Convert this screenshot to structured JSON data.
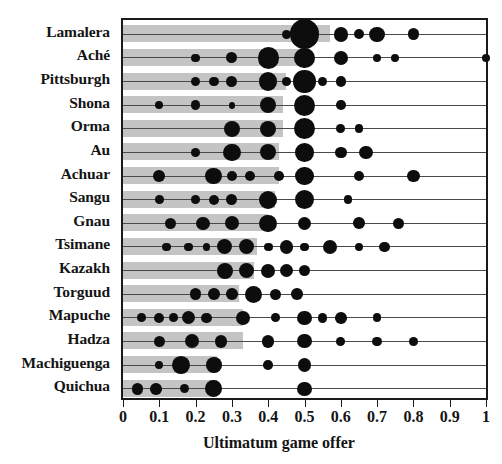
{
  "chart_data": {
    "type": "scatter",
    "title": "",
    "xlabel": "Ultimatum game offer",
    "ylabel": "",
    "xlim": [
      0,
      1
    ],
    "xticks": [
      0,
      0.1,
      0.2,
      0.3,
      0.4,
      0.5,
      0.6,
      0.7,
      0.8,
      0.9,
      1
    ],
    "xticklabels": [
      "0",
      "0.1",
      "0.2",
      "0.3",
      "0.4",
      "0.5",
      "0.6",
      "0.7",
      "0.8",
      "0.9",
      "1"
    ],
    "grid": false,
    "legend": null,
    "marker_note": "Dot area proportional to proportion of offers at that value; gray bar length = mean offer",
    "categories": [
      "Lamalera",
      "Aché",
      "Pittsburgh",
      "Shona",
      "Orma",
      "Au",
      "Achuar",
      "Sangu",
      "Gnau",
      "Tsimane",
      "Kazakh",
      "Torguud",
      "Mapuche",
      "Hadza",
      "Machiguenga",
      "Quichua"
    ],
    "rows": [
      {
        "label": "Lamalera",
        "mean": 0.57,
        "points": [
          {
            "x": 0.45,
            "w": 0.06
          },
          {
            "x": 0.5,
            "w": 0.58
          },
          {
            "x": 0.6,
            "w": 0.14
          },
          {
            "x": 0.65,
            "w": 0.07
          },
          {
            "x": 0.7,
            "w": 0.16
          },
          {
            "x": 0.8,
            "w": 0.09
          }
        ]
      },
      {
        "label": "Aché",
        "mean": 0.5,
        "points": [
          {
            "x": 0.2,
            "w": 0.05
          },
          {
            "x": 0.3,
            "w": 0.08
          },
          {
            "x": 0.4,
            "w": 0.3
          },
          {
            "x": 0.5,
            "w": 0.27
          },
          {
            "x": 0.6,
            "w": 0.13
          },
          {
            "x": 0.7,
            "w": 0.05
          },
          {
            "x": 0.75,
            "w": 0.04
          },
          {
            "x": 1.0,
            "w": 0.05
          }
        ]
      },
      {
        "label": "Pittsburgh",
        "mean": 0.45,
        "points": [
          {
            "x": 0.2,
            "w": 0.06
          },
          {
            "x": 0.25,
            "w": 0.06
          },
          {
            "x": 0.3,
            "w": 0.08
          },
          {
            "x": 0.4,
            "w": 0.22
          },
          {
            "x": 0.45,
            "w": 0.05
          },
          {
            "x": 0.5,
            "w": 0.33
          },
          {
            "x": 0.55,
            "w": 0.06
          },
          {
            "x": 0.6,
            "w": 0.07
          }
        ]
      },
      {
        "label": "Shona",
        "mean": 0.44,
        "points": [
          {
            "x": 0.1,
            "w": 0.04
          },
          {
            "x": 0.2,
            "w": 0.06
          },
          {
            "x": 0.3,
            "w": 0.03
          },
          {
            "x": 0.4,
            "w": 0.17
          },
          {
            "x": 0.5,
            "w": 0.3
          },
          {
            "x": 0.6,
            "w": 0.06
          }
        ]
      },
      {
        "label": "Orma",
        "mean": 0.44,
        "points": [
          {
            "x": 0.3,
            "w": 0.17
          },
          {
            "x": 0.4,
            "w": 0.17
          },
          {
            "x": 0.5,
            "w": 0.3
          },
          {
            "x": 0.6,
            "w": 0.05
          },
          {
            "x": 0.65,
            "w": 0.05
          }
        ]
      },
      {
        "label": "Au",
        "mean": 0.43,
        "points": [
          {
            "x": 0.2,
            "w": 0.05
          },
          {
            "x": 0.3,
            "w": 0.2
          },
          {
            "x": 0.4,
            "w": 0.17
          },
          {
            "x": 0.5,
            "w": 0.23
          },
          {
            "x": 0.6,
            "w": 0.09
          },
          {
            "x": 0.67,
            "w": 0.12
          }
        ]
      },
      {
        "label": "Achuar",
        "mean": 0.43,
        "points": [
          {
            "x": 0.1,
            "w": 0.09
          },
          {
            "x": 0.25,
            "w": 0.18
          },
          {
            "x": 0.3,
            "w": 0.07
          },
          {
            "x": 0.35,
            "w": 0.07
          },
          {
            "x": 0.43,
            "w": 0.06
          },
          {
            "x": 0.5,
            "w": 0.22
          },
          {
            "x": 0.65,
            "w": 0.07
          },
          {
            "x": 0.8,
            "w": 0.1
          }
        ]
      },
      {
        "label": "Sangu",
        "mean": 0.42,
        "points": [
          {
            "x": 0.1,
            "w": 0.05
          },
          {
            "x": 0.2,
            "w": 0.05
          },
          {
            "x": 0.25,
            "w": 0.07
          },
          {
            "x": 0.3,
            "w": 0.08
          },
          {
            "x": 0.4,
            "w": 0.22
          },
          {
            "x": 0.5,
            "w": 0.24
          },
          {
            "x": 0.62,
            "w": 0.05
          }
        ]
      },
      {
        "label": "Gnau",
        "mean": 0.4,
        "points": [
          {
            "x": 0.13,
            "w": 0.08
          },
          {
            "x": 0.22,
            "w": 0.12
          },
          {
            "x": 0.3,
            "w": 0.13
          },
          {
            "x": 0.4,
            "w": 0.2
          },
          {
            "x": 0.5,
            "w": 0.11
          },
          {
            "x": 0.65,
            "w": 0.09
          },
          {
            "x": 0.76,
            "w": 0.08
          }
        ]
      },
      {
        "label": "Tsimane",
        "mean": 0.37,
        "points": [
          {
            "x": 0.12,
            "w": 0.05
          },
          {
            "x": 0.18,
            "w": 0.05
          },
          {
            "x": 0.23,
            "w": 0.04
          },
          {
            "x": 0.28,
            "w": 0.15
          },
          {
            "x": 0.34,
            "w": 0.15
          },
          {
            "x": 0.4,
            "w": 0.05
          },
          {
            "x": 0.45,
            "w": 0.12
          },
          {
            "x": 0.5,
            "w": 0.05
          },
          {
            "x": 0.57,
            "w": 0.14
          },
          {
            "x": 0.65,
            "w": 0.04
          },
          {
            "x": 0.72,
            "w": 0.07
          }
        ]
      },
      {
        "label": "Kazakh",
        "mean": 0.36,
        "points": [
          {
            "x": 0.28,
            "w": 0.17
          },
          {
            "x": 0.34,
            "w": 0.15
          },
          {
            "x": 0.4,
            "w": 0.13
          },
          {
            "x": 0.45,
            "w": 0.12
          },
          {
            "x": 0.5,
            "w": 0.09
          }
        ]
      },
      {
        "label": "Torguud",
        "mean": 0.32,
        "points": [
          {
            "x": 0.2,
            "w": 0.09
          },
          {
            "x": 0.25,
            "w": 0.09
          },
          {
            "x": 0.3,
            "w": 0.09
          },
          {
            "x": 0.36,
            "w": 0.19
          },
          {
            "x": 0.42,
            "w": 0.08
          },
          {
            "x": 0.48,
            "w": 0.09
          }
        ]
      },
      {
        "label": "Mapuche",
        "mean": 0.33,
        "points": [
          {
            "x": 0.05,
            "w": 0.05
          },
          {
            "x": 0.1,
            "w": 0.07
          },
          {
            "x": 0.14,
            "w": 0.05
          },
          {
            "x": 0.18,
            "w": 0.11
          },
          {
            "x": 0.23,
            "w": 0.07
          },
          {
            "x": 0.33,
            "w": 0.13
          },
          {
            "x": 0.42,
            "w": 0.05
          },
          {
            "x": 0.5,
            "w": 0.14
          },
          {
            "x": 0.55,
            "w": 0.06
          },
          {
            "x": 0.6,
            "w": 0.09
          },
          {
            "x": 0.7,
            "w": 0.05
          }
        ]
      },
      {
        "label": "Hadza",
        "mean": 0.33,
        "points": [
          {
            "x": 0.1,
            "w": 0.08
          },
          {
            "x": 0.19,
            "w": 0.13
          },
          {
            "x": 0.27,
            "w": 0.11
          },
          {
            "x": 0.4,
            "w": 0.1
          },
          {
            "x": 0.5,
            "w": 0.13
          },
          {
            "x": 0.6,
            "w": 0.05
          },
          {
            "x": 0.7,
            "w": 0.06
          },
          {
            "x": 0.8,
            "w": 0.05
          }
        ]
      },
      {
        "label": "Machiguenga",
        "mean": 0.26,
        "points": [
          {
            "x": 0.1,
            "w": 0.04
          },
          {
            "x": 0.16,
            "w": 0.21
          },
          {
            "x": 0.25,
            "w": 0.16
          },
          {
            "x": 0.4,
            "w": 0.06
          },
          {
            "x": 0.5,
            "w": 0.12
          }
        ]
      },
      {
        "label": "Quichua",
        "mean": 0.26,
        "points": [
          {
            "x": 0.04,
            "w": 0.09
          },
          {
            "x": 0.09,
            "w": 0.09
          },
          {
            "x": 0.17,
            "w": 0.06
          },
          {
            "x": 0.25,
            "w": 0.18
          },
          {
            "x": 0.5,
            "w": 0.13
          }
        ]
      }
    ]
  }
}
